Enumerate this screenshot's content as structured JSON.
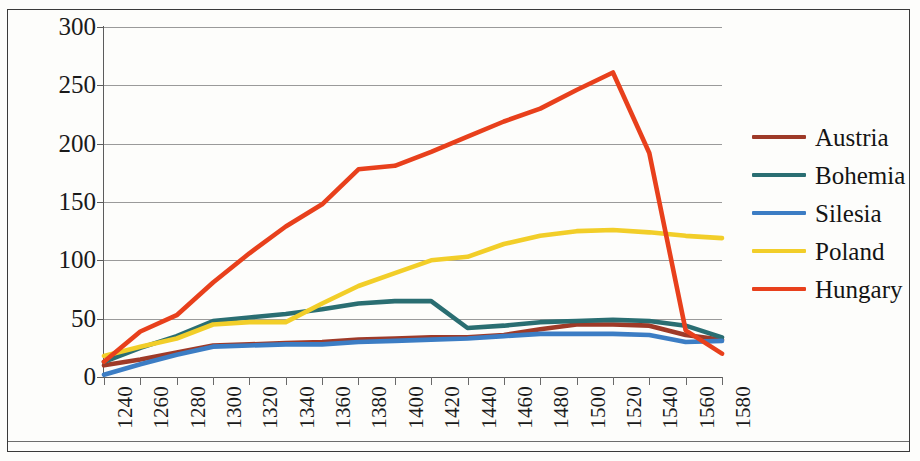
{
  "chart_data": {
    "type": "line",
    "title": "",
    "subtitle": "",
    "xlabel": "",
    "ylabel": "",
    "xlim": [
      1240,
      1580
    ],
    "ylim": [
      0,
      300
    ],
    "grid": true,
    "legend_position": "right",
    "categories": [
      1240,
      1260,
      1280,
      1300,
      1320,
      1340,
      1360,
      1380,
      1400,
      1420,
      1440,
      1460,
      1480,
      1500,
      1520,
      1540,
      1560,
      1580
    ],
    "x_tick_labels": [
      "1240",
      "1260",
      "1280",
      "1300",
      "1320",
      "1340",
      "1360",
      "1380",
      "1400",
      "1420",
      "1440",
      "1460",
      "1480",
      "1500",
      "1520",
      "1540",
      "1560",
      "1580"
    ],
    "y_tick_labels": [
      "0",
      "50",
      "100",
      "150",
      "200",
      "250",
      "300"
    ],
    "y_ticks": [
      0,
      50,
      100,
      150,
      200,
      250,
      300
    ],
    "series": [
      {
        "name": "Austria",
        "color": "#9E3A28",
        "values": [
          10,
          15,
          21,
          27,
          28,
          29,
          30,
          32,
          33,
          34,
          34,
          36,
          41,
          45,
          45,
          44,
          36,
          32
        ]
      },
      {
        "name": "Bohemia",
        "color": "#2A6E72",
        "values": [
          13,
          25,
          35,
          48,
          51,
          54,
          58,
          63,
          65,
          65,
          42,
          44,
          47,
          48,
          49,
          48,
          44,
          34
        ]
      },
      {
        "name": "Silesia",
        "color": "#3C7DC4",
        "values": [
          2,
          11,
          19,
          26,
          27,
          28,
          28,
          30,
          31,
          32,
          33,
          35,
          37,
          37,
          37,
          36,
          30,
          31
        ]
      },
      {
        "name": "Poland",
        "color": "#F2CE29",
        "values": [
          18,
          26,
          33,
          45,
          47,
          47,
          63,
          78,
          89,
          100,
          103,
          114,
          121,
          125,
          126,
          124,
          121,
          119
        ]
      },
      {
        "name": "Hungary",
        "color": "#E8401C",
        "values": [
          13,
          39,
          53,
          81,
          106,
          129,
          148,
          178,
          181,
          193,
          206,
          219,
          230,
          246,
          261,
          192,
          40,
          20
        ]
      }
    ]
  },
  "legend": {
    "items": [
      {
        "label": "Austria",
        "color": "#9E3A28"
      },
      {
        "label": "Bohemia",
        "color": "#2A6E72"
      },
      {
        "label": "Silesia",
        "color": "#3C7DC4"
      },
      {
        "label": "Poland",
        "color": "#F2CE29"
      },
      {
        "label": "Hungary",
        "color": "#E8401C"
      }
    ]
  }
}
